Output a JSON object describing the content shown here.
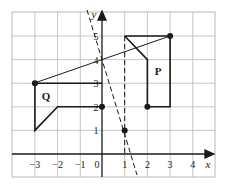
{
  "figure": {
    "type": "coordinate-grid",
    "x_axis": {
      "label": "x",
      "min": -3,
      "max": 4,
      "ticks": [
        "-3",
        "-2",
        "-1",
        "0",
        "1",
        "2",
        "3",
        "4"
      ]
    },
    "y_axis": {
      "label": "y",
      "min": 1,
      "max": 5,
      "ticks": [
        "1",
        "2",
        "3",
        "4",
        "5"
      ]
    },
    "shapes": [
      {
        "label": "P",
        "vertices": [
          [
            1,
            5
          ],
          [
            3,
            5
          ],
          [
            3,
            2
          ],
          [
            2,
            2
          ],
          [
            2,
            4
          ],
          [
            1,
            5
          ]
        ]
      },
      {
        "label": "Q",
        "vertices": [
          [
            0,
            3
          ],
          [
            -3,
            3
          ],
          [
            -3,
            1
          ],
          [
            -2,
            2
          ],
          [
            0,
            2
          ]
        ]
      }
    ],
    "points": [
      [
        -3,
        3
      ],
      [
        3,
        5
      ],
      [
        0,
        2
      ],
      [
        2,
        2
      ],
      [
        1,
        1
      ]
    ],
    "lines": [
      {
        "style": "solid",
        "from": [
          -3,
          3
        ],
        "to": [
          3,
          5
        ]
      },
      {
        "style": "dashed",
        "from": [
          1,
          5
        ],
        "to": [
          1,
          0
        ]
      },
      {
        "style": "dashed",
        "through": [
          [
            0,
            4
          ],
          [
            1,
            1
          ]
        ]
      }
    ],
    "colors": {
      "grid": "#b8b8b8",
      "ink": "#1a1a1a",
      "background": "#ffffff"
    }
  }
}
